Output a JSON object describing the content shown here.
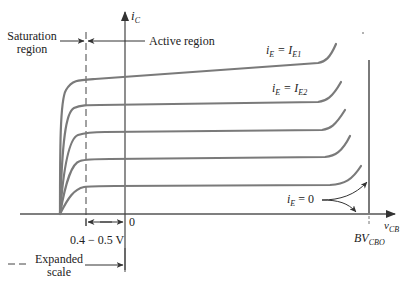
{
  "diagram": {
    "y_axis": {
      "label_main": "i",
      "label_sub": "C"
    },
    "x_axis": {
      "label_main": "v",
      "label_sub": "CB"
    },
    "regions": {
      "saturation_line1": "Saturation",
      "saturation_line2": "region",
      "active": "Active region"
    },
    "curve_labels": {
      "ie1_lhs": "i",
      "ie1_lhs_sub": "E",
      "ie1_rhs": " = I",
      "ie1_rhs_sub": "E1",
      "ie2_lhs": "i",
      "ie2_lhs_sub": "E",
      "ie2_rhs": " = I",
      "ie2_rhs_sub": "E2",
      "ie0_lhs": "i",
      "ie0_lhs_sub": "E",
      "ie0_rhs": " = 0"
    },
    "ticks": {
      "zero": "0",
      "voltage_range": "0.4 − 0.5 V",
      "breakdown_main": "BV",
      "breakdown_sub": "CBO"
    },
    "legend": {
      "expanded_line1": "Expanded",
      "expanded_line2": "scale"
    },
    "colors": {
      "curve": "#7a7a7a",
      "axis": "#555555",
      "text": "#222222"
    }
  }
}
